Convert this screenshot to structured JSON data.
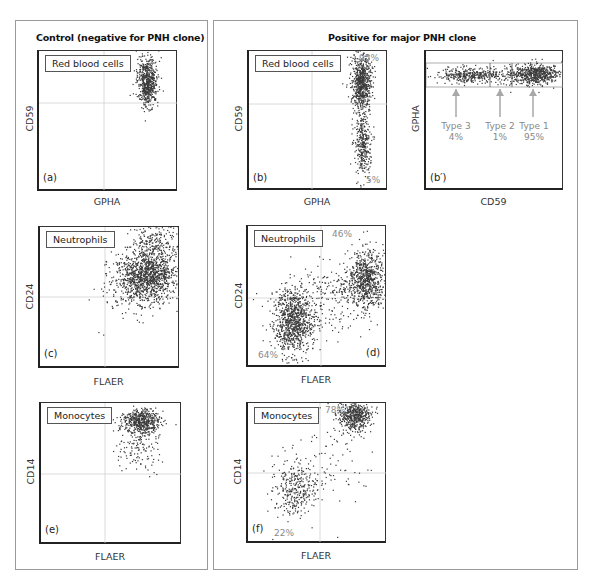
{
  "figure": {
    "left_panel": {
      "title": "Control (negative for PNH clone)"
    },
    "right_panel": {
      "title": "Positive for major PNH clone"
    },
    "plots": {
      "a": {
        "tag": "(a)",
        "cell": "Red blood cells",
        "xlabel": "GPHA",
        "ylabel": "CD59"
      },
      "b": {
        "tag": "(b)",
        "cell": "Red blood cells",
        "xlabel": "GPHA",
        "ylabel": "CD59",
        "upper_pct": "95%",
        "lower_pct": "5%"
      },
      "bp": {
        "tag": "(b′)",
        "xlabel": "CD59",
        "ylabel": "GPHA",
        "types": [
          {
            "label": "Type 3",
            "pct": "4%"
          },
          {
            "label": "Type 2",
            "pct": "1%"
          },
          {
            "label": "Type 1",
            "pct": "95%"
          }
        ]
      },
      "c": {
        "tag": "(c)",
        "cell": "Neutrophils",
        "xlabel": "FLAER",
        "ylabel": "CD24"
      },
      "d": {
        "tag": "(d)",
        "cell": "Neutrophils",
        "xlabel": "FLAER",
        "ylabel": "CD24",
        "upper_pct": "46%",
        "lower_pct": "64%"
      },
      "e": {
        "tag": "(e)",
        "cell": "Monocytes",
        "xlabel": "FLAER",
        "ylabel": "CD14"
      },
      "f": {
        "tag": "(f)",
        "cell": "Monocytes",
        "xlabel": "FLAER",
        "ylabel": "CD14",
        "upper_pct": "78%",
        "lower_pct": "22%"
      }
    }
  },
  "colors": {
    "dots": "#3a3a3a",
    "gate": "#c8c8c8",
    "arrow": "#a8a8a8",
    "panel_border": "#9a9a9a"
  },
  "chart_data": [
    {
      "type": "scatter",
      "title": "(a) Red blood cells — Control",
      "xlabel": "GPHA",
      "ylabel": "CD59",
      "clusters": [
        {
          "name": "CD59+ RBC",
          "x_center": 0.82,
          "y_center": 0.78,
          "fraction": 1.0
        }
      ]
    },
    {
      "type": "scatter",
      "title": "(b) Red blood cells — PNH",
      "xlabel": "GPHA",
      "ylabel": "CD59",
      "clusters": [
        {
          "name": "CD59+ (upper)",
          "x_center": 0.83,
          "y_center": 0.78,
          "fraction": 0.95
        },
        {
          "name": "CD59− (lower)",
          "x_center": 0.84,
          "y_center": 0.33,
          "fraction": 0.05
        }
      ],
      "annotations": [
        "95%",
        "5%"
      ]
    },
    {
      "type": "scatter",
      "title": "(b′) Red blood cells — PNH types",
      "xlabel": "CD59",
      "ylabel": "GPHA",
      "categories": [
        "Type 3",
        "Type 2",
        "Type 1"
      ],
      "values": [
        4,
        1,
        95
      ]
    },
    {
      "type": "scatter",
      "title": "(c) Neutrophils — Control",
      "xlabel": "FLAER",
      "ylabel": "CD24",
      "clusters": [
        {
          "name": "FLAER+ CD24+",
          "x_center": 0.8,
          "y_center": 0.62,
          "fraction": 1.0
        }
      ]
    },
    {
      "type": "scatter",
      "title": "(d) Neutrophils — PNH",
      "xlabel": "FLAER",
      "ylabel": "CD24",
      "clusters": [
        {
          "name": "FLAER+ CD24+",
          "x_center": 0.85,
          "y_center": 0.68,
          "fraction": 0.46
        },
        {
          "name": "FLAER− CD24−",
          "x_center": 0.3,
          "y_center": 0.28,
          "fraction": 0.64
        }
      ],
      "annotations": [
        "46%",
        "64%"
      ]
    },
    {
      "type": "scatter",
      "title": "(e) Monocytes — Control",
      "xlabel": "FLAER",
      "ylabel": "CD14",
      "clusters": [
        {
          "name": "FLAER+ CD14+",
          "x_center": 0.77,
          "y_center": 0.85,
          "fraction": 1.0
        }
      ]
    },
    {
      "type": "scatter",
      "title": "(f) Monocytes — PNH",
      "xlabel": "FLAER",
      "ylabel": "CD14",
      "clusters": [
        {
          "name": "FLAER+ CD14+",
          "x_center": 0.78,
          "y_center": 0.9,
          "fraction": 0.78
        },
        {
          "name": "FLAER− CD14−",
          "x_center": 0.35,
          "y_center": 0.35,
          "fraction": 0.22
        }
      ],
      "annotations": [
        "78%",
        "22%"
      ]
    }
  ]
}
